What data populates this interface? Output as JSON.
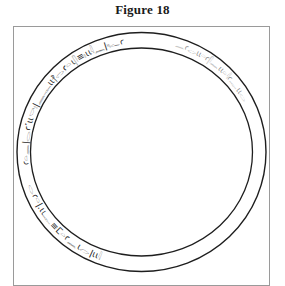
{
  "figure": {
    "title": "Figure 18",
    "inscription_dark": "ꜥ𓏏𓈖ǀ𓂋ꜥ˹ιι𓎡𓏤ǀ𓈖𓊃ιι⳨𓂋ꜥ𓏏ι𓋴≡𓏤ιι𓇋𓈖ǀ𓆑ꜥ",
    "inscription_faint": "𓈖ꜥ𓂋ιι𓏏ꜥ𓋴𓈖ιι𓏏𓇋ꜥ𓊃ιι𓂋",
    "inscription_bottom": "𓂋ꜥ𓏏ǀ.ιι𓊃≡ⵎ𓏏ꜥ𓈖ι𓂋ǀιι𓇋",
    "colors": {
      "ink": "#1e1e1e",
      "faint_ink": "#8c8c8c",
      "frame": "#9a9a9a",
      "background": "#ffffff"
    }
  }
}
